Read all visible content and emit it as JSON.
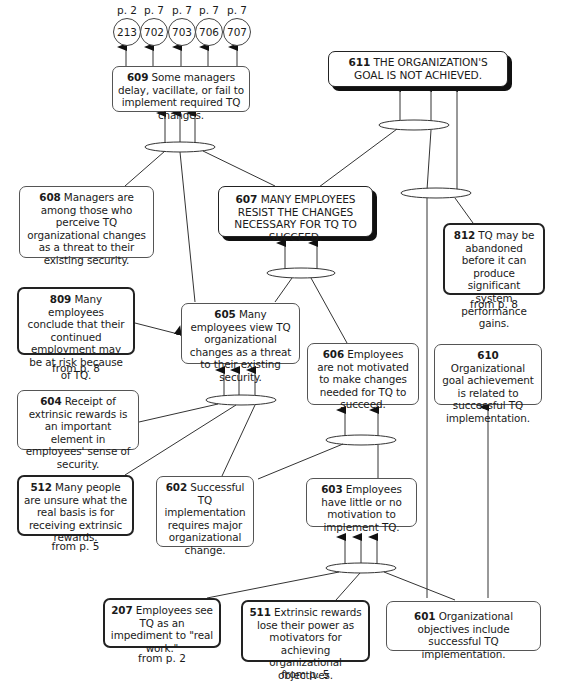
{
  "page_refs": [
    {
      "id": "213",
      "from": "p. 2"
    },
    {
      "id": "702",
      "from": "p. 7"
    },
    {
      "id": "703",
      "from": "p. 7"
    },
    {
      "id": "706",
      "from": "p. 7"
    },
    {
      "id": "707",
      "from": "p. 7"
    }
  ],
  "nodes": {
    "n611": {
      "num": "611",
      "text": "THE ORGANIZATION'S GOAL IS NOT ACHIEVED."
    },
    "n609": {
      "num": "609",
      "text": "Some managers delay, vacillate, or fail to implement required TQ changes."
    },
    "n608": {
      "num": "608",
      "text": "Managers are among those who perceive TQ organizational changes as a threat to their existing security."
    },
    "n607": {
      "num": "607",
      "text": "MANY EMPLOYEES RESIST THE CHANGES NECESSARY FOR TQ TO SUCCEED."
    },
    "n812": {
      "num": "812",
      "text": "TQ may be abandoned before it can produce significant system performance gains.",
      "source": "from p. 8"
    },
    "n809": {
      "num": "809",
      "text": "Many employees conclude that their continued employment may be at risk because of TQ.",
      "source": "from p. 8"
    },
    "n605": {
      "num": "605",
      "text": "Many employees view TQ organizational changes as a threat to their existing security."
    },
    "n606": {
      "num": "606",
      "text": "Employees are not motivated to make changes needed for TQ to succeed."
    },
    "n610": {
      "num": "610",
      "text": "Organizational goal achievement is related to successful TQ implementation."
    },
    "n604": {
      "num": "604",
      "text": "Receipt of extrinsic rewards is an important element in employees' sense of security."
    },
    "n512": {
      "num": "512",
      "text": "Many people are unsure what the real basis is for receiving extrinsic rewards.",
      "source": "from p. 5"
    },
    "n602": {
      "num": "602",
      "text": "Successful TQ implementation requires major organizational change."
    },
    "n603": {
      "num": "603",
      "text": "Employees have little or no motivation to implement TQ."
    },
    "n207": {
      "num": "207",
      "text": "Employees see TQ as an impediment to \"real work.\"",
      "source": "from p. 2"
    },
    "n511": {
      "num": "511",
      "text": "Extrinsic rewards lose their power as motivators for achieving organizational objectives.",
      "source": "from p. 5"
    },
    "n601": {
      "num": "601",
      "text": "Organizational objectives include successful TQ implementation."
    }
  },
  "colors": {
    "line": "#333333",
    "background": "#ffffff",
    "text": "#1a1a1a"
  }
}
